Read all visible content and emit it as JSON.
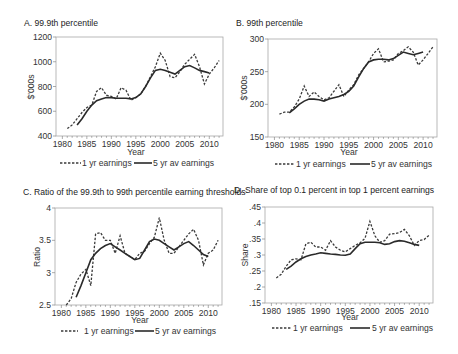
{
  "chart_data": [
    {
      "id": "A",
      "type": "line",
      "title": "A. 99.9th percentile",
      "xlabel": "Year",
      "ylabel": "$'000s",
      "xlim": [
        1978.7,
        2012.8
      ],
      "ylim": [
        400,
        1200
      ],
      "xticks": [
        1980,
        1985,
        1990,
        1995,
        2000,
        2005,
        2010
      ],
      "yticks": [
        400,
        600,
        800,
        1000,
        1200
      ],
      "ytick_labels": [
        "400",
        "600",
        "800",
        "1000",
        "1200"
      ],
      "grid": false,
      "legend_position": "bottom",
      "series": [
        {
          "name": "1 yr earnings",
          "style": "dashed",
          "x": [
            1981,
            1982,
            1983,
            1984,
            1985,
            1986,
            1987,
            1988,
            1989,
            1990,
            1991,
            1992,
            1993,
            1994,
            1995,
            1996,
            1997,
            1998,
            1999,
            2000,
            2001,
            2002,
            2003,
            2004,
            2005,
            2006,
            2007,
            2008,
            2009,
            2010,
            2011,
            2012
          ],
          "values": [
            460,
            490,
            540,
            590,
            630,
            650,
            760,
            790,
            730,
            720,
            700,
            790,
            770,
            690,
            710,
            740,
            800,
            880,
            960,
            1070,
            1010,
            880,
            870,
            920,
            980,
            1020,
            1060,
            960,
            820,
            900,
            950,
            1010
          ]
        },
        {
          "name": "5 yr av earnings",
          "style": "solid",
          "x": [
            1983,
            1984,
            1985,
            1986,
            1987,
            1988,
            1989,
            1990,
            1991,
            1992,
            1993,
            1994,
            1995,
            1996,
            1997,
            1998,
            1999,
            2000,
            2001,
            2002,
            2003,
            2004,
            2005,
            2006,
            2007,
            2008,
            2009,
            2010
          ],
          "values": [
            490,
            540,
            600,
            650,
            685,
            700,
            710,
            710,
            705,
            705,
            705,
            700,
            710,
            740,
            800,
            870,
            930,
            940,
            930,
            915,
            900,
            930,
            960,
            970,
            950,
            930,
            920,
            910
          ]
        }
      ]
    },
    {
      "id": "B",
      "type": "line",
      "title": "B. 99th percentile",
      "xlabel": "Year",
      "ylabel": "$'000s",
      "xlim": [
        1978.7,
        2012.8
      ],
      "ylim": [
        150,
        300
      ],
      "xticks": [
        1980,
        1985,
        1990,
        1995,
        2000,
        2005,
        2010
      ],
      "yticks": [
        150,
        200,
        250,
        300
      ],
      "ytick_labels": [
        "150",
        "200",
        "250",
        "300"
      ],
      "grid": false,
      "legend_position": "bottom",
      "series": [
        {
          "name": "1 yr earnings",
          "style": "dashed",
          "x": [
            1981,
            1982,
            1983,
            1984,
            1985,
            1986,
            1987,
            1988,
            1989,
            1990,
            1991,
            1992,
            1993,
            1994,
            1995,
            1996,
            1997,
            1998,
            1999,
            2000,
            2001,
            2002,
            2003,
            2004,
            2005,
            2006,
            2007,
            2008,
            2009,
            2010,
            2011,
            2012
          ],
          "values": [
            185,
            188,
            188,
            196,
            208,
            228,
            212,
            219,
            212,
            207,
            210,
            220,
            230,
            212,
            222,
            230,
            245,
            255,
            265,
            278,
            285,
            265,
            266,
            268,
            278,
            282,
            288,
            280,
            260,
            268,
            278,
            288
          ]
        },
        {
          "name": "5 yr av earnings",
          "style": "solid",
          "x": [
            1983,
            1984,
            1985,
            1986,
            1987,
            1988,
            1989,
            1990,
            1991,
            1992,
            1993,
            1994,
            1995,
            1996,
            1997,
            1998,
            1999,
            2000,
            2001,
            2002,
            2003,
            2004,
            2005,
            2006,
            2007,
            2008,
            2009,
            2010
          ],
          "values": [
            187,
            193,
            200,
            205,
            208,
            208,
            207,
            205,
            208,
            210,
            212,
            215,
            220,
            228,
            242,
            255,
            265,
            268,
            269,
            269,
            268,
            270,
            275,
            280,
            278,
            276,
            278,
            280
          ]
        }
      ]
    },
    {
      "id": "C",
      "type": "line",
      "title": "C. Ratio of the 99.9th to 99th percentile earning thresholds",
      "xlabel": "Year",
      "ylabel": "Ratio",
      "xlim": [
        1978.7,
        2012.8
      ],
      "ylim": [
        2.5,
        4
      ],
      "xticks": [
        1980,
        1985,
        1990,
        1995,
        2000,
        2005,
        2010
      ],
      "yticks": [
        2.5,
        3,
        3.5,
        4
      ],
      "ytick_labels": [
        "2.5",
        "3",
        "3.5",
        "4"
      ],
      "grid": false,
      "legend_position": "bottom",
      "series": [
        {
          "name": "1 yr earnings",
          "style": "dashed",
          "x": [
            1981,
            1982,
            1983,
            1984,
            1985,
            1986,
            1987,
            1988,
            1989,
            1990,
            1991,
            1992,
            1993,
            1994,
            1995,
            1996,
            1997,
            1998,
            1999,
            2000,
            2001,
            2002,
            2003,
            2004,
            2005,
            2006,
            2007,
            2008,
            2009,
            2010,
            2011,
            2012
          ],
          "values": [
            2.5,
            2.6,
            2.85,
            2.98,
            3.05,
            2.8,
            3.6,
            3.62,
            3.5,
            3.5,
            3.3,
            3.57,
            3.3,
            3.25,
            3.2,
            3.3,
            3.33,
            3.45,
            3.55,
            3.85,
            3.5,
            3.3,
            3.3,
            3.4,
            3.5,
            3.6,
            3.67,
            3.5,
            3.12,
            3.3,
            3.35,
            3.5
          ]
        },
        {
          "name": "5 yr av earnings",
          "style": "solid",
          "x": [
            1983,
            1984,
            1985,
            1986,
            1987,
            1988,
            1989,
            1990,
            1991,
            1992,
            1993,
            1994,
            1995,
            1996,
            1997,
            1998,
            1999,
            2000,
            2001,
            2002,
            2003,
            2004,
            2005,
            2006,
            2007,
            2008,
            2009,
            2010
          ],
          "values": [
            2.62,
            2.8,
            3.0,
            3.2,
            3.3,
            3.37,
            3.42,
            3.45,
            3.4,
            3.35,
            3.3,
            3.25,
            3.2,
            3.22,
            3.35,
            3.48,
            3.52,
            3.5,
            3.45,
            3.4,
            3.35,
            3.4,
            3.45,
            3.48,
            3.42,
            3.35,
            3.28,
            3.25
          ]
        }
      ]
    },
    {
      "id": "D",
      "type": "line",
      "title": "D. Share of top 0.1 percent in top 1 percent earnings",
      "xlabel": "Year",
      "ylabel": "Share",
      "xlim": [
        1978.7,
        2012.8
      ],
      "ylim": [
        0.15,
        0.45
      ],
      "xticks": [
        1980,
        1985,
        1990,
        1995,
        2000,
        2005,
        2010
      ],
      "yticks": [
        0.15,
        0.2,
        0.25,
        0.3,
        0.35,
        0.4,
        0.45
      ],
      "ytick_labels": [
        ".15",
        ".2",
        ".25",
        ".3",
        ".35",
        ".4",
        ".45"
      ],
      "grid": false,
      "legend_position": "bottom",
      "series": [
        {
          "name": "1 yr earnings",
          "style": "dashed",
          "x": [
            1981,
            1982,
            1983,
            1984,
            1985,
            1986,
            1987,
            1988,
            1989,
            1990,
            1991,
            1992,
            1993,
            1994,
            1995,
            1996,
            1997,
            1998,
            1999,
            2000,
            2001,
            2002,
            2003,
            2004,
            2005,
            2006,
            2007,
            2008,
            2009,
            2010,
            2011,
            2012
          ],
          "values": [
            0.228,
            0.24,
            0.265,
            0.285,
            0.288,
            0.285,
            0.335,
            0.34,
            0.325,
            0.325,
            0.315,
            0.345,
            0.325,
            0.315,
            0.31,
            0.32,
            0.33,
            0.338,
            0.352,
            0.405,
            0.36,
            0.34,
            0.345,
            0.365,
            0.367,
            0.37,
            0.38,
            0.36,
            0.33,
            0.345,
            0.348,
            0.362
          ]
        },
        {
          "name": "5 yr av earnings",
          "style": "solid",
          "x": [
            1983,
            1984,
            1985,
            1986,
            1987,
            1988,
            1989,
            1990,
            1991,
            1992,
            1993,
            1994,
            1995,
            1996,
            1997,
            1998,
            1999,
            2000,
            2001,
            2002,
            2003,
            2004,
            2005,
            2006,
            2007,
            2008,
            2009,
            2010
          ],
          "values": [
            0.255,
            0.265,
            0.278,
            0.288,
            0.295,
            0.3,
            0.303,
            0.307,
            0.305,
            0.303,
            0.302,
            0.3,
            0.299,
            0.303,
            0.32,
            0.335,
            0.34,
            0.34,
            0.34,
            0.338,
            0.333,
            0.335,
            0.342,
            0.345,
            0.343,
            0.338,
            0.333,
            0.33
          ]
        }
      ]
    }
  ],
  "legend": {
    "dashed_label": "1 yr earnings",
    "solid_label": "5 yr av earnings"
  },
  "axis": {
    "x_title": "Year"
  }
}
